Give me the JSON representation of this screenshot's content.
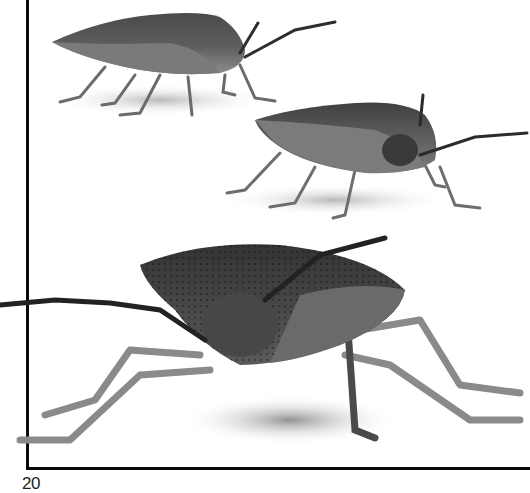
{
  "page": {
    "page_number": "20",
    "background": "#ffffff",
    "frame_color": "#0a0a0a"
  },
  "photos": [
    {
      "subject": "shield bug side view (small)",
      "tone": "grayscale"
    },
    {
      "subject": "shield bug three-quarter view (medium)",
      "tone": "grayscale"
    },
    {
      "subject": "shield bug front view (large)",
      "tone": "grayscale"
    }
  ]
}
